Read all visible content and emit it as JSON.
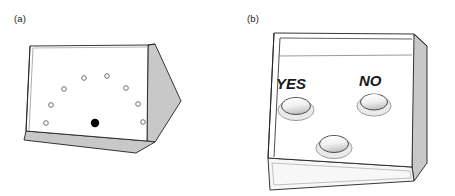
{
  "figure": {
    "type": "line-art-apparatus-diagram",
    "background_color": "#ffffff",
    "stroke_color": "#231f20",
    "shade_gray": "#c8c8c8",
    "shade_gray_dark": "#b4b4b4",
    "rim_gray": "#d8d8d8",
    "panels": [
      {
        "id": "a",
        "caption": "(a)",
        "device_name": "response-box-with-dot-array",
        "top_face_color": "#ffffff",
        "side_face_color": "#c8c8c8",
        "markers": {
          "open_circle_count": 8,
          "filled_circle_count": 1,
          "open_circle_label": "open-marker",
          "filled_circle_label": "filled-marker",
          "filled_circle_color": "#000000",
          "open_circle_stroke": "#6e6e6e",
          "arrangement": "ring-of-eight-with-one-filled-at-bottom-center",
          "open_circles": [
            {
              "cx": 84,
              "cy": 78,
              "r": 2.3
            },
            {
              "cx": 107,
              "cy": 76,
              "r": 2.3
            },
            {
              "cx": 64,
              "cy": 89,
              "r": 2.3
            },
            {
              "cx": 126,
              "cy": 88,
              "r": 2.3
            },
            {
              "cx": 51,
              "cy": 105,
              "r": 2.3
            },
            {
              "cx": 138,
              "cy": 104,
              "r": 2.3
            },
            {
              "cx": 46,
              "cy": 123,
              "r": 2.3
            },
            {
              "cx": 143,
              "cy": 122,
              "r": 2.3
            }
          ],
          "filled_circle": {
            "cx": 95,
            "cy": 123,
            "r": 4.2
          }
        }
      },
      {
        "id": "b",
        "caption": "(b)",
        "device_name": "three-button-response-box",
        "top_face_color": "#ffffff",
        "side_face_color": "#c8c8c8",
        "buttons": [
          {
            "name": "yes-button",
            "label": "YES",
            "label_x": 62,
            "label_y": 90,
            "cx": 68,
            "cy": 108,
            "rx": 15,
            "ry": 9
          },
          {
            "name": "no-button",
            "label": "NO",
            "label_x": 142,
            "label_y": 88,
            "cx": 146,
            "cy": 104,
            "rx": 14,
            "ry": 8.5
          },
          {
            "name": "third-button",
            "label": "",
            "label_x": 0,
            "label_y": 0,
            "cx": 106,
            "cy": 145,
            "rx": 15,
            "ry": 9
          }
        ]
      }
    ]
  }
}
